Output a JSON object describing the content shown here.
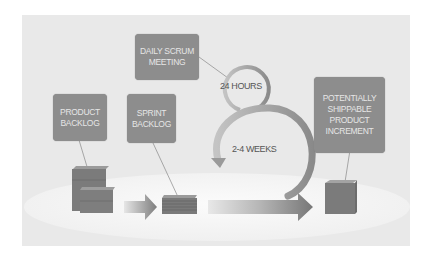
{
  "diagram": {
    "type": "scrum-process-flow",
    "boxes": {
      "daily_scrum": {
        "line1": "DAILY SCRUM",
        "line2": "MEETING"
      },
      "product_backlog": {
        "line1": "PRODUCT",
        "line2": "BACKLOG"
      },
      "sprint_backlog": {
        "line1": "SPRINT",
        "line2": "BACKLOG"
      },
      "increment": {
        "line1": "POTENTIALLY",
        "line2": "SHIPPABLE",
        "line3": "PRODUCT",
        "line4": "INCREMENT"
      }
    },
    "loops": {
      "small": {
        "label": "24 HOURS"
      },
      "large": {
        "label": "2-4 WEEKS"
      }
    },
    "colors": {
      "panel": "#e9e9e9",
      "box": "#8d8d8d",
      "box_text": "#e6e6e6",
      "cube": "#7a7a7a",
      "platform": "#f7f7f7"
    }
  }
}
